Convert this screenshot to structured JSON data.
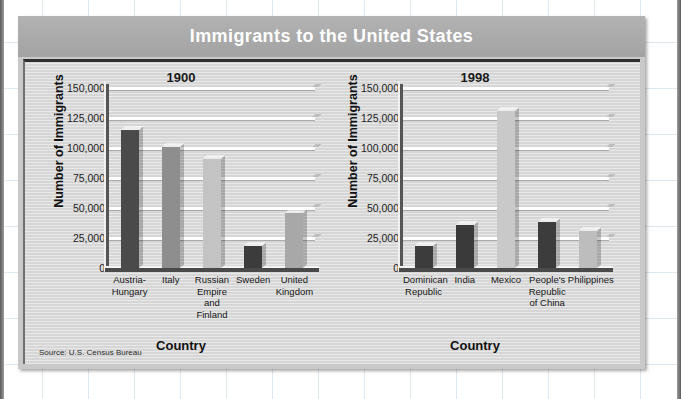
{
  "figure": {
    "title": "Immigrants to the United States",
    "source": "Source: U.S. Census Bureau",
    "colors": {
      "title_bar": "#a8a8a8",
      "plot_background": "#d6d6d6",
      "gridline": "#ffffff",
      "bar_dark": "#4a4a4a",
      "bar_medium": "#8e8e8e",
      "bar_light": "#c4c4c4",
      "title_text": "#ffffff"
    }
  },
  "chart_data": [
    {
      "type": "bar",
      "title": "1900",
      "xlabel": "Country",
      "ylabel": "Number of Immigrants",
      "ylim": [
        0,
        150000
      ],
      "yticks": [
        "150,000",
        "125,000",
        "100,000",
        "75,000",
        "50,000",
        "25,000",
        "0"
      ],
      "ytick_values": [
        150000,
        125000,
        100000,
        75000,
        50000,
        25000,
        0
      ],
      "grid": true,
      "legend": "none",
      "categories": [
        "Austria-\nHungary",
        "Italy",
        "Russian\nEmpire\nand Finland",
        "Sweden",
        "United\nKingdom"
      ],
      "category_lines": [
        [
          "Austria-",
          "Hungary"
        ],
        [
          "Italy"
        ],
        [
          "Russian",
          "Empire",
          "and Finland"
        ],
        [
          "Sweden"
        ],
        [
          "United",
          "Kingdom"
        ]
      ],
      "values": [
        115000,
        101000,
        91000,
        18000,
        46000
      ],
      "bar_colors": [
        "#4a4a4a",
        "#8e8e8e",
        "#c4c4c4",
        "#3c3c3c",
        "#a8a8a8"
      ]
    },
    {
      "type": "bar",
      "title": "1998",
      "xlabel": "Country",
      "ylabel": "Number of Immigrants",
      "ylim": [
        0,
        150000
      ],
      "yticks": [
        "150,000",
        "125,000",
        "100,000",
        "75,000",
        "50,000",
        "25,000",
        "0"
      ],
      "ytick_values": [
        150000,
        125000,
        100000,
        75000,
        50000,
        25000,
        0
      ],
      "grid": true,
      "legend": "none",
      "categories": [
        "Dominican\nRepublic",
        "India",
        "Mexico",
        "People's\nRepublic\nof China",
        "Philippines"
      ],
      "category_lines": [
        [
          "Dominican",
          "Republic"
        ],
        [
          "India"
        ],
        [
          "Mexico"
        ],
        [
          "People's",
          "Republic",
          "of China"
        ],
        [
          "Philippines"
        ]
      ],
      "values": [
        18000,
        36000,
        131000,
        38000,
        31000
      ],
      "bar_colors": [
        "#3c3c3c",
        "#3a3a3a",
        "#c9c9c9",
        "#3c3c3c",
        "#bdbdbd"
      ]
    }
  ]
}
